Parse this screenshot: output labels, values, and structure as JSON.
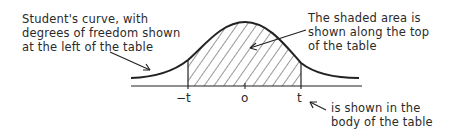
{
  "diagram": {
    "type": "t-distribution illustration",
    "annotations": {
      "left": [
        "Student's curve, with",
        "degrees of freedom shown",
        "at the left of the table"
      ],
      "right_top": [
        "The shaded area is",
        "shown along the top",
        "of the table"
      ],
      "right_bottom": [
        "is shown in the",
        "body of the table"
      ]
    },
    "axis_labels": {
      "neg_t": "−t",
      "zero": "o",
      "t": "t"
    },
    "colors": {
      "ink": "#222222",
      "background": "#ffffff"
    }
  }
}
